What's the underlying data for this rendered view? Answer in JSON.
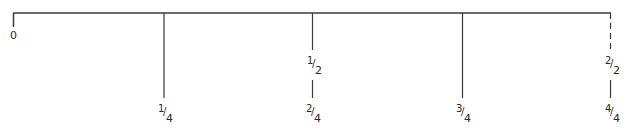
{
  "diagram": {
    "type": "fraction-number-line",
    "line_color": "#3a3a3a",
    "axis": {
      "start_label": "0"
    },
    "ticks": [
      {
        "position": 0,
        "labels": [
          {
            "whole": "0"
          }
        ]
      },
      {
        "position": 0.25,
        "labels": [
          {
            "num": "1",
            "den": "4"
          }
        ]
      },
      {
        "position": 0.5,
        "labels": [
          {
            "num": "1",
            "den": "2"
          },
          {
            "num": "2",
            "den": "4"
          }
        ]
      },
      {
        "position": 0.75,
        "labels": [
          {
            "num": "3",
            "den": "4"
          }
        ]
      },
      {
        "position": 1,
        "labels": [
          {
            "num": "2",
            "den": "2"
          },
          {
            "num": "4",
            "den": "4"
          }
        ]
      }
    ],
    "label_zero": "0",
    "q1": {
      "num": "1",
      "den": "4"
    },
    "half": {
      "num": "1",
      "den": "2"
    },
    "q2": {
      "num": "2",
      "den": "4"
    },
    "q3": {
      "num": "3",
      "den": "4"
    },
    "whole_halves": {
      "num": "2",
      "den": "2"
    },
    "q4": {
      "num": "4",
      "den": "4"
    },
    "slash": "/"
  }
}
